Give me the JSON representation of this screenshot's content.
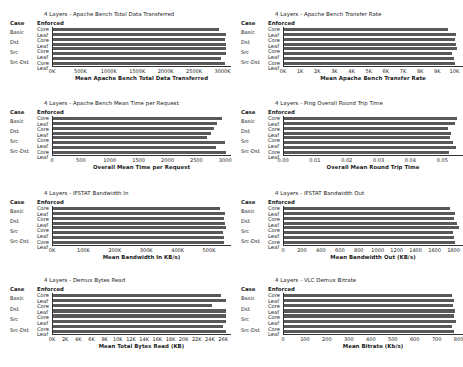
{
  "figure": {
    "background": "#ffffff",
    "bar_color": "#595959",
    "axis_color": "#333333",
    "rows": {
      "case_header": "Case",
      "enforced_header": "Enforced"
    },
    "cases": [
      "Basic",
      "Dst",
      "Src",
      "Src-Dst"
    ],
    "enforced": [
      "Core",
      "Leaf"
    ]
  },
  "chart_data": [
    {
      "type": "bar",
      "orientation": "horizontal",
      "title": "4 Layers - Apache Bench Total Data Transferred",
      "xlabel": "Mean Apache Bench Total Data Transferred",
      "ylabel": "",
      "grid": false,
      "legend": "none",
      "categories": [
        "Basic / Core",
        "Basic / Leaf",
        "Dst / Core",
        "Dst / Leaf",
        "Src / Core",
        "Src / Leaf",
        "Src-Dst / Core",
        "Src-Dst / Leaf"
      ],
      "values": [
        2930000,
        3060000,
        3050000,
        3060000,
        3070000,
        3060000,
        2970000,
        3040000
      ],
      "xlim": [
        0,
        3150000
      ],
      "xticks": [
        0,
        500000,
        1000000,
        1500000,
        2000000,
        2500000,
        3000000
      ],
      "xticklabels": [
        "0K",
        "500K",
        "1000K",
        "1500K",
        "2000K",
        "2500K",
        "3000K"
      ]
    },
    {
      "type": "bar",
      "orientation": "horizontal",
      "title": "4 Layers - Apache Bench Transfer Rate",
      "xlabel": "Mean Apache Bench Transfer Rate",
      "ylabel": "",
      "grid": false,
      "legend": "none",
      "categories": [
        "Basic / Core",
        "Basic / Leaf",
        "Dst / Core",
        "Dst / Leaf",
        "Src / Core",
        "Src / Leaf",
        "Src-Dst / Core",
        "Src-Dst / Leaf"
      ],
      "values": [
        9600,
        10100,
        10050,
        10100,
        10150,
        9850,
        9950,
        10050
      ],
      "xlim": [
        0,
        10500
      ],
      "xticks": [
        0,
        1000,
        2000,
        3000,
        4000,
        5000,
        6000,
        7000,
        8000,
        9000,
        10000
      ],
      "xticklabels": [
        "0K",
        "1K",
        "2K",
        "3K",
        "4K",
        "5K",
        "6K",
        "7K",
        "8K",
        "9K",
        "10K"
      ]
    },
    {
      "type": "bar",
      "orientation": "horizontal",
      "title": "4 Layers - Apache Bench Mean Time per Request",
      "xlabel": "Overall Mean Time per Request",
      "ylabel": "",
      "grid": false,
      "legend": "none",
      "categories": [
        "Basic / Core",
        "Basic / Leaf",
        "Dst / Core",
        "Dst / Leaf",
        "Src / Core",
        "Src / Leaf",
        "Src-Dst / Core",
        "Src-Dst / Leaf"
      ],
      "values": [
        2950,
        2850,
        2800,
        2760,
        2680,
        2990,
        2840,
        3020
      ],
      "xlim": [
        0,
        3100
      ],
      "xticks": [
        0,
        500,
        1000,
        1500,
        2000,
        2500,
        3000
      ],
      "xticklabels": [
        "0",
        "500",
        "1000",
        "1500",
        "2000",
        "2500",
        "3000"
      ]
    },
    {
      "type": "bar",
      "orientation": "horizontal",
      "title": "4 Layers - Ping Overall Round Trip Time",
      "xlabel": "Overall Mean Round Trip Time",
      "ylabel": "",
      "grid": false,
      "legend": "none",
      "categories": [
        "Basic / Core",
        "Basic / Leaf",
        "Dst / Core",
        "Dst / Leaf",
        "Src / Core",
        "Src / Leaf",
        "Src-Dst / Core",
        "Src-Dst / Leaf"
      ],
      "values": [
        0.0545,
        0.054,
        0.0518,
        0.0527,
        0.0523,
        0.0532,
        0.0543,
        0.0521
      ],
      "xlim": [
        0,
        0.0565
      ],
      "xticks": [
        0.0,
        0.01,
        0.02,
        0.03,
        0.04,
        0.05
      ],
      "xticklabels": [
        "0.00",
        "0.01",
        "0.02",
        "0.03",
        "0.04",
        "0.05"
      ]
    },
    {
      "type": "bar",
      "orientation": "horizontal",
      "title": "4 Layers - IFSTAT Bandwidth In",
      "xlabel": "Mean Bandwidth In KB/s)",
      "ylabel": "",
      "grid": false,
      "legend": "none",
      "categories": [
        "Basic / Core",
        "Basic / Leaf",
        "Dst / Core",
        "Dst / Leaf",
        "Src / Core",
        "Src / Leaf",
        "Src-Dst / Core",
        "Src-Dst / Leaf"
      ],
      "values": [
        535000,
        551000,
        548000,
        551000,
        553000,
        543000,
        546000,
        547000
      ],
      "xlim": [
        0,
        570000
      ],
      "xticks": [
        0,
        100000,
        200000,
        300000,
        400000,
        500000
      ],
      "xticklabels": [
        "0K",
        "100K",
        "200K",
        "300K",
        "400K",
        "500K"
      ]
    },
    {
      "type": "bar",
      "orientation": "horizontal",
      "title": "4 Layers - IFSTAT Bandwidth Out",
      "xlabel": "Mean Bandwidth Out (KB/s)",
      "ylabel": "",
      "grid": false,
      "legend": "none",
      "categories": [
        "Basic / Core",
        "Basic / Leaf",
        "Dst / Core",
        "Dst / Leaf",
        "Src / Core",
        "Src / Leaf",
        "Src-Dst / Core",
        "Src-Dst / Leaf"
      ],
      "values": [
        1760,
        1810,
        1800,
        1840,
        1860,
        1790,
        1800,
        1810
      ],
      "xlim": [
        0,
        1900
      ],
      "xticks": [
        0,
        200,
        400,
        600,
        800,
        1000,
        1200,
        1400,
        1600,
        1800
      ],
      "xticklabels": [
        "0",
        "200",
        "400",
        "600",
        "800",
        "1000",
        "1200",
        "1400",
        "1600",
        "1800"
      ]
    },
    {
      "type": "bar",
      "orientation": "horizontal",
      "title": "4 Layers - Demux Bytes Read",
      "xlabel": "Mean Total Bytes Read (KB)",
      "ylabel": "",
      "grid": false,
      "legend": "none",
      "categories": [
        "Basic / Core",
        "Basic / Leaf",
        "Dst / Core",
        "Dst / Leaf",
        "Src / Core",
        "Src / Leaf",
        "Src-Dst / Core",
        "Src-Dst / Leaf"
      ],
      "values": [
        25600,
        26400,
        24300,
        26400,
        26400,
        26400,
        26000,
        26400
      ],
      "xlim": [
        0,
        27200
      ],
      "xticks": [
        0,
        2000,
        4000,
        6000,
        8000,
        10000,
        12000,
        14000,
        16000,
        18000,
        20000,
        22000,
        24000,
        26000
      ],
      "xticklabels": [
        "0K",
        "2K",
        "4K",
        "6K",
        "8K",
        "10K",
        "12K",
        "14K",
        "16K",
        "18K",
        "20K",
        "22K",
        "24K",
        "26K"
      ]
    },
    {
      "type": "bar",
      "orientation": "horizontal",
      "title": "4 Layers - VLC Demux Bitrate",
      "xlabel": "Mean Bitrate (Kb/s)",
      "ylabel": "",
      "grid": false,
      "legend": "none",
      "categories": [
        "Basic / Core",
        "Basic / Leaf",
        "Dst / Core",
        "Dst / Leaf",
        "Src / Core",
        "Src / Leaf",
        "Src-Dst / Core",
        "Src-Dst / Leaf"
      ],
      "values": [
        770,
        780,
        775,
        785,
        780,
        790,
        770,
        780
      ],
      "xlim": [
        0,
        820
      ],
      "xticks": [
        0,
        100,
        200,
        300,
        400,
        500,
        600,
        700,
        800
      ],
      "xticklabels": [
        "0",
        "100",
        "200",
        "300",
        "400",
        "500",
        "600",
        "700",
        "800"
      ]
    }
  ]
}
